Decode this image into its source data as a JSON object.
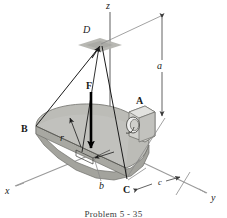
{
  "figure": {
    "caption": "Problem 5 - 35",
    "background_color": "#ffffff",
    "plate_face_color": "#b9b9b4",
    "plate_edge_color": "#8f8f8a",
    "plate_side_color": "#a3a39d",
    "line_color": "#1a1a1a",
    "dimension_color": "#6b6b6b",
    "patch_color": "#b0b0ab"
  },
  "axes": [
    {
      "id": "z",
      "label": "z",
      "x": 109,
      "y": 4
    },
    {
      "id": "x",
      "label": "x",
      "x": 6,
      "y": 189
    },
    {
      "id": "y",
      "label": "y",
      "x": 212,
      "y": 196
    }
  ],
  "points": [
    {
      "id": "D",
      "label": "D",
      "x": 86,
      "y": 28,
      "description": "cable apex above plate"
    },
    {
      "id": "A",
      "label": "A",
      "x": 138,
      "y": 99,
      "description": "bearing support"
    },
    {
      "id": "B",
      "label": "B",
      "x": 24,
      "y": 127,
      "description": "plate corner support"
    },
    {
      "id": "C",
      "label": "C",
      "x": 126,
      "y": 188,
      "description": "plate corner support"
    }
  ],
  "dimensions": [
    {
      "id": "a",
      "label": "a",
      "x": 153,
      "y": 64,
      "description": "vertical height from plate plane to D"
    },
    {
      "id": "b",
      "label": "b",
      "x": 101,
      "y": 185,
      "description": "offset to centroid underside"
    },
    {
      "id": "c",
      "label": "c",
      "x": 158,
      "y": 182,
      "description": "horizontal offset along y"
    },
    {
      "id": "r",
      "label": "r",
      "x": 61,
      "y": 137,
      "description": "radius of semicircular plate"
    }
  ],
  "forces": [
    {
      "id": "F",
      "label": "F",
      "x": 83,
      "y": 84,
      "direction": "downward",
      "description": "applied load on plate"
    }
  ]
}
